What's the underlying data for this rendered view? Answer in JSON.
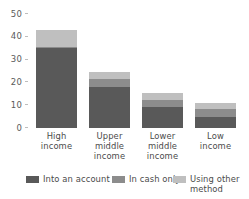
{
  "chart_data": {
    "type": "bar",
    "subtype": "stacked-bar",
    "title": "",
    "subtitle": "",
    "xlabel": "",
    "ylabel": "",
    "ylim": [
      0,
      50
    ],
    "yticks": [
      0,
      10,
      20,
      30,
      40,
      50
    ],
    "ytick_labels": [
      "0",
      "10",
      "20",
      "30",
      "40",
      "50"
    ],
    "grid": false,
    "legend_position": "bottom",
    "categories": [
      "High\nincome",
      "Upper\nmiddle\nincome",
      "Lower\nmiddle\nincome",
      "Low\nincome"
    ],
    "series": [
      {
        "name": "Into an account",
        "color": "#595959",
        "values": [
          35,
          18,
          9,
          5
        ]
      },
      {
        "name": "In cash only",
        "color": "#8c8c8c",
        "values": [
          0.5,
          3.5,
          3.5,
          3.5
        ]
      },
      {
        "name": "Using other method",
        "color": "#bfbfbf",
        "values": [
          7.5,
          3,
          3,
          2.5
        ]
      }
    ],
    "totals": [
      43,
      24.5,
      15.5,
      11
    ]
  },
  "axis": {
    "y": {
      "ticks": [
        {
          "label": "50",
          "value": 50
        },
        {
          "label": "40",
          "value": 40
        },
        {
          "label": "30",
          "value": 30
        },
        {
          "label": "20",
          "value": 20
        },
        {
          "label": "10",
          "value": 10
        },
        {
          "label": "0",
          "value": 0
        }
      ]
    },
    "x": {
      "labels": [
        "High\nincome",
        "Upper\nmiddle\nincome",
        "Lower\nmiddle\nincome",
        "Low\nincome"
      ]
    }
  },
  "legend": {
    "items": [
      {
        "label": "Into an account",
        "color": "#595959"
      },
      {
        "label": "In cash only",
        "color": "#8c8c8c"
      },
      {
        "label": "Using other\nmethod",
        "color": "#bfbfbf"
      }
    ]
  },
  "colors": {
    "background": "#ffffff",
    "text": "#4a4a4a",
    "tick": "#bdbdbd",
    "series_1": "#595959",
    "series_2": "#8c8c8c",
    "series_3": "#bfbfbf"
  }
}
